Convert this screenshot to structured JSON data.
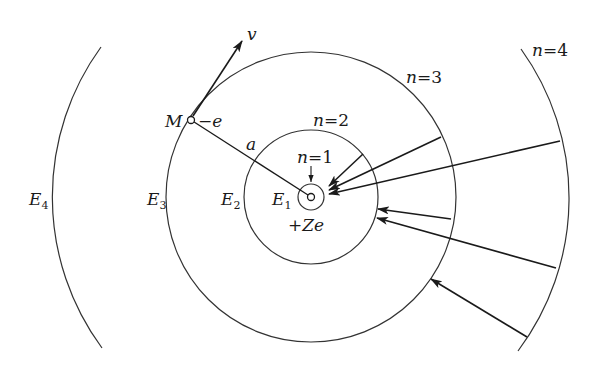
{
  "figure": {
    "nucleus": {
      "label_plus": "+",
      "label_Z": "Z",
      "label_e": "e"
    },
    "electron": {
      "label": "M",
      "charge": "−e",
      "velocity_label": "v"
    },
    "radius_label": "a",
    "orbits": [
      {
        "n_label": "n",
        "eq": "=",
        "n": "1",
        "energy_label": "E",
        "energy_sub": "1"
      },
      {
        "n_label": "n",
        "eq": "=",
        "n": "2",
        "energy_label": "E",
        "energy_sub": "2"
      },
      {
        "n_label": "n",
        "eq": "=",
        "n": "3",
        "energy_label": "E",
        "energy_sub": "3"
      },
      {
        "n_label": "n",
        "eq": "=",
        "n": "4",
        "energy_label": "E",
        "energy_sub": "4"
      }
    ],
    "transitions": [
      {
        "from": 2,
        "to": 1
      },
      {
        "from": 3,
        "to": 1
      },
      {
        "from": 4,
        "to": 1
      },
      {
        "from": 3,
        "to": 2
      },
      {
        "from": 4,
        "to": 2
      },
      {
        "from": 4,
        "to": 3
      }
    ],
    "colors": {
      "ink": "#1a1a1a",
      "orbit": "#333333",
      "background": "#ffffff"
    }
  }
}
